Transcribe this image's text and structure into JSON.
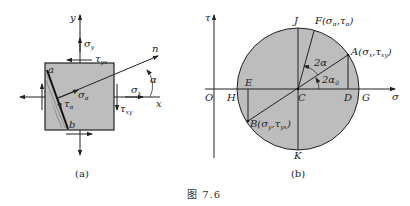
{
  "figure": {
    "caption": "图 7.6",
    "colors": {
      "fill": "#bdbdbd",
      "stroke": "#222222",
      "background": "#ffffff"
    }
  },
  "panel_a": {
    "label": "(a)",
    "axis_y": "y",
    "axis_x": "x",
    "normal": "n",
    "angle": "α",
    "corner_a": "a",
    "corner_b": "b",
    "sigma_y": {
      "base": "σ",
      "sub": "y"
    },
    "sigma_x": {
      "base": "σ",
      "sub": "x"
    },
    "tau_yx": {
      "base": "τ",
      "sub": "yx"
    },
    "tau_xy": {
      "base": "τ",
      "sub": "xy"
    },
    "sigma_alpha": {
      "base": "σ",
      "sub": "α"
    },
    "tau_alpha": {
      "base": "τ",
      "sub": "α"
    }
  },
  "panel_b": {
    "label": "(b)",
    "axis_tau": "τ",
    "axis_sigma": "σ",
    "origin": "O",
    "points": {
      "J": "J",
      "K": "K",
      "H": "H",
      "G": "G",
      "C": "C",
      "D": "D",
      "E": "E",
      "F": "F(σα,τα)",
      "A": "A(σx,τxy)",
      "B": "B(σy,τyx)"
    },
    "point_F": {
      "name": "F",
      "s1": "α",
      "s2": "α"
    },
    "point_A": {
      "name": "A",
      "s1": "x",
      "s2": "xy"
    },
    "point_B": {
      "name": "B",
      "s1": "y",
      "s2": "yx"
    },
    "angle_2alpha": "2α",
    "angle_2alpha0": {
      "base": "2α",
      "sub": "0"
    }
  }
}
